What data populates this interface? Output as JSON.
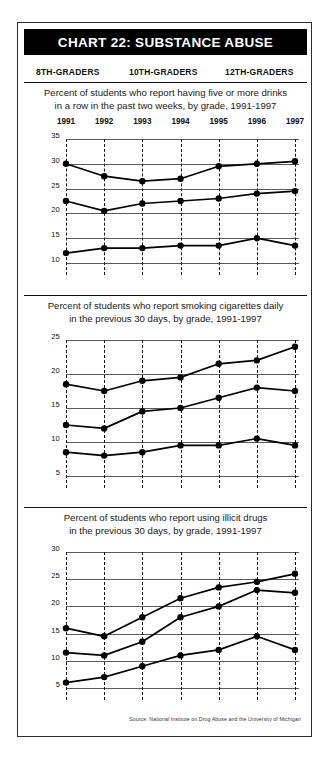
{
  "header": {
    "title": "CHART 22: SUBSTANCE ABUSE"
  },
  "legend": {
    "position": "top",
    "items": [
      {
        "label": "8TH-GRADERS",
        "key": "grade8"
      },
      {
        "label": "10TH-GRADERS",
        "key": "grade10"
      },
      {
        "label": "12TH-GRADERS",
        "key": "grade12"
      }
    ]
  },
  "source": "Source: National Institute on Drug Abuse and the University of Michigan",
  "colors": {
    "ink": "#000000",
    "title_bar_bg": "#000000",
    "title_bar_text": "#ffffff",
    "gridline": "#5a5a5a",
    "line": "#000000",
    "marker": "#000000",
    "page": "#ffffff"
  },
  "chart_data": [
    {
      "type": "line",
      "id": "binge-drinking",
      "title": "Percent of students who report having five or more drinks in a row in the past two weeks, by grade, 1991-1997",
      "title_line1": "Percent of students who report having five or more drinks",
      "title_line2": "in a row in the past two weeks, by grade, 1991-1997",
      "xlabel": "",
      "ylabel": "",
      "x": [
        1991,
        1992,
        1993,
        1994,
        1995,
        1996,
        1997
      ],
      "categories": [
        "1991",
        "1992",
        "1993",
        "1994",
        "1995",
        "1996",
        "1997"
      ],
      "ylim": [
        10,
        35
      ],
      "yticks": [
        10,
        15,
        20,
        25,
        30,
        35
      ],
      "ytick_labels": [
        "10",
        "15",
        "20",
        "25",
        "30",
        "35"
      ],
      "grid": true,
      "legend": "top",
      "series": [
        {
          "name": "12TH-GRADERS",
          "values": [
            30.0,
            27.5,
            26.5,
            27.0,
            29.5,
            30.0,
            30.5
          ]
        },
        {
          "name": "10TH-GRADERS",
          "values": [
            22.5,
            20.5,
            22.0,
            22.5,
            23.0,
            24.0,
            24.5
          ]
        },
        {
          "name": "8TH-GRADERS",
          "values": [
            12.0,
            13.0,
            13.0,
            13.5,
            13.5,
            15.0,
            13.5
          ]
        }
      ]
    },
    {
      "type": "line",
      "id": "daily-smoking",
      "title": "Percent of students who report smoking cigarettes daily in the previous 30 days, by grade, 1991-1997",
      "title_line1": "Percent of students who report smoking cigarettes daily",
      "title_line2": "in the previous 30 days, by grade, 1991-1997",
      "xlabel": "",
      "ylabel": "",
      "x": [
        1991,
        1992,
        1993,
        1994,
        1995,
        1996,
        1997
      ],
      "categories": [
        "1991",
        "1992",
        "1993",
        "1994",
        "1995",
        "1996",
        "1997"
      ],
      "ylim": [
        5,
        25
      ],
      "yticks": [
        5,
        10,
        15,
        20,
        25
      ],
      "ytick_labels": [
        "5",
        "10",
        "15",
        "20",
        "25"
      ],
      "grid": true,
      "legend": "top",
      "series": [
        {
          "name": "12TH-GRADERS",
          "values": [
            18.5,
            17.5,
            19.0,
            19.5,
            21.5,
            22.0,
            24.0
          ]
        },
        {
          "name": "10TH-GRADERS",
          "values": [
            12.5,
            12.0,
            14.5,
            15.0,
            16.5,
            18.0,
            17.5
          ]
        },
        {
          "name": "8TH-GRADERS",
          "values": [
            8.5,
            8.0,
            8.5,
            9.5,
            9.5,
            10.5,
            9.5
          ]
        }
      ]
    },
    {
      "type": "line",
      "id": "illicit-drugs",
      "title": "Percent of students who report using illicit drugs in the previous 30 days, by grade, 1991-1997",
      "title_line1": "Percent of students who report using illicit drugs",
      "title_line2": "in the previous 30 days, by grade, 1991-1997",
      "xlabel": "",
      "ylabel": "",
      "x": [
        1991,
        1992,
        1993,
        1994,
        1995,
        1996,
        1997
      ],
      "categories": [
        "1991",
        "1992",
        "1993",
        "1994",
        "1995",
        "1996",
        "1997"
      ],
      "ylim": [
        5,
        30
      ],
      "yticks": [
        5,
        10,
        15,
        20,
        25,
        30
      ],
      "ytick_labels": [
        "5",
        "10",
        "15",
        "20",
        "25",
        "30"
      ],
      "grid": true,
      "legend": "top",
      "series": [
        {
          "name": "12TH-GRADERS",
          "values": [
            16.0,
            14.5,
            18.0,
            21.5,
            23.5,
            24.5,
            26.0
          ]
        },
        {
          "name": "10TH-GRADERS",
          "values": [
            11.5,
            11.0,
            13.5,
            18.0,
            20.0,
            23.0,
            22.5
          ]
        },
        {
          "name": "8TH-GRADERS",
          "values": [
            6.0,
            7.0,
            9.0,
            11.0,
            12.0,
            14.5,
            12.0
          ]
        }
      ]
    }
  ]
}
